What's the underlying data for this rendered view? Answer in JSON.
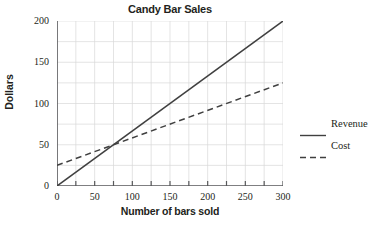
{
  "chart_data": {
    "type": "line",
    "title": "Candy Bar Sales",
    "xlabel": "Number of bars sold",
    "ylabel": "Dollars",
    "xlim": [
      0,
      300
    ],
    "ylim": [
      0,
      200
    ],
    "x_major_ticks": [
      0,
      50,
      100,
      150,
      200,
      250,
      300
    ],
    "x_minor_step": 25,
    "y_major_ticks": [
      0,
      50,
      100,
      150,
      200
    ],
    "y_minor_step": 25,
    "x_tick_labels": [
      "0",
      "50",
      "100",
      "150",
      "200",
      "250",
      "300"
    ],
    "y_tick_labels": [
      "0",
      "50",
      "100",
      "150",
      "200"
    ],
    "grid": true,
    "grid_color": "#d9d9d9",
    "axis_color": "#58595b",
    "line_color": "#404040",
    "legend_position": "right",
    "series": [
      {
        "name": "Revenue",
        "style": "solid",
        "x": [
          0,
          300
        ],
        "y": [
          0,
          200
        ],
        "slope": 0.6667,
        "intercept": 0
      },
      {
        "name": "Cost",
        "style": "dashed",
        "x": [
          0,
          300
        ],
        "y": [
          25,
          125
        ],
        "slope": 0.3333,
        "intercept": 25
      }
    ],
    "annotations": [
      {
        "label": "break-even intersection",
        "x": 75,
        "y": 50
      }
    ]
  },
  "legend": {
    "items": [
      {
        "label": "Revenue",
        "style": "solid"
      },
      {
        "label": "Cost",
        "style": "dashed"
      }
    ]
  }
}
